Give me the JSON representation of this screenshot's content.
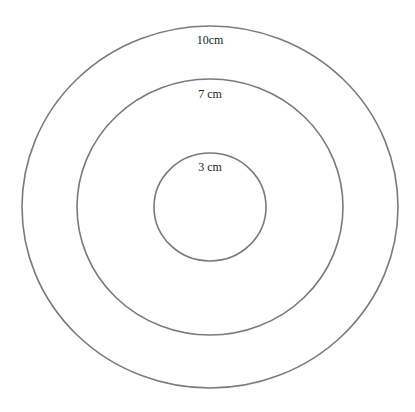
{
  "diagram": {
    "type": "concentric-circles",
    "stroke_color": "#7a7a7a",
    "background": "#ffffff",
    "center": {
      "x": 210,
      "y": 207
    },
    "circles": [
      {
        "id": "outer",
        "label": "10cm",
        "rx": 188,
        "ry": 181,
        "label_x": 210,
        "label_y": 34
      },
      {
        "id": "middle",
        "label": "7 cm",
        "rx": 133,
        "ry": 128,
        "label_x": 210,
        "label_y": 88
      },
      {
        "id": "inner",
        "label": "3 cm",
        "rx": 56,
        "ry": 54,
        "label_x": 210,
        "label_y": 161
      }
    ]
  }
}
